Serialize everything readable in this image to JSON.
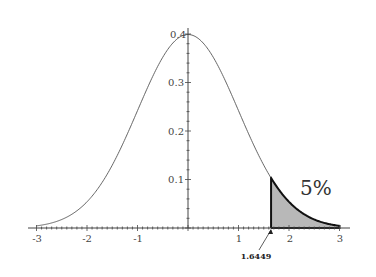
{
  "chart_data": {
    "type": "area",
    "title": "",
    "xlabel": "",
    "ylabel": "",
    "xlim": [
      -3,
      3
    ],
    "ylim": [
      0,
      0.4
    ],
    "grid": false,
    "curve": "standard normal density",
    "x_ticks": [
      "-3",
      "-2",
      "-1",
      "1",
      "2",
      "3"
    ],
    "y_ticks": [
      "0.1",
      "0.2",
      "0.3",
      "0.4"
    ],
    "shaded_region": {
      "from": 1.6449,
      "to": 3,
      "fill": "#b8b8b8"
    },
    "annotations": [
      {
        "text": "5%",
        "x": 2.4,
        "y": 0.075
      },
      {
        "text": "1.6449",
        "x": 1.6449,
        "y": 0,
        "arrow": true
      }
    ]
  },
  "labels": {
    "x": [
      "-3",
      "-2",
      "-1",
      "1",
      "2",
      "3"
    ],
    "y": [
      "0.1",
      "0.2",
      "0.3",
      "0.4"
    ],
    "percent": "5%",
    "critical": "1.6449"
  }
}
